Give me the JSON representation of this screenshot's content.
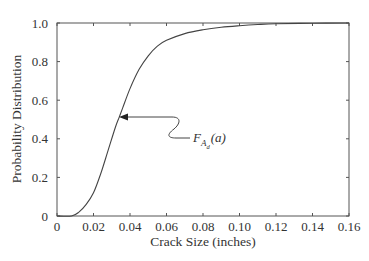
{
  "chart_data": {
    "type": "line",
    "title": "",
    "xlabel": "Crack Size (inches)",
    "ylabel": "Probability Distribution",
    "xlim": [
      0,
      0.16
    ],
    "ylim": [
      0,
      1.0
    ],
    "grid": false,
    "legend": null,
    "x_ticks": [
      "0",
      "0.02",
      "0.04",
      "0.06",
      "0.08",
      "0.10",
      "0.12",
      "0.14",
      "0.16"
    ],
    "y_ticks": [
      "0",
      "0.2",
      "0.4",
      "0.6",
      "0.8",
      "1.0"
    ],
    "series": [
      {
        "name": "F_{A_d}(a)",
        "x": [
          0,
          0.008,
          0.012,
          0.016,
          0.02,
          0.024,
          0.028,
          0.032,
          0.034,
          0.036,
          0.04,
          0.045,
          0.05,
          0.055,
          0.06,
          0.07,
          0.08,
          0.09,
          0.1,
          0.11,
          0.12,
          0.14,
          0.16
        ],
        "y": [
          0,
          0.0,
          0.02,
          0.06,
          0.12,
          0.22,
          0.34,
          0.46,
          0.51,
          0.56,
          0.66,
          0.76,
          0.83,
          0.88,
          0.91,
          0.945,
          0.965,
          0.978,
          0.986,
          0.992,
          0.996,
          0.999,
          1.0
        ]
      }
    ],
    "annotations": [
      {
        "text": "F_{A_d}(a)",
        "main": "F",
        "sub1": "A",
        "sub2": "d",
        "arg": "(a)",
        "arrow_to": [
          0.034,
          0.51
        ]
      }
    ]
  }
}
